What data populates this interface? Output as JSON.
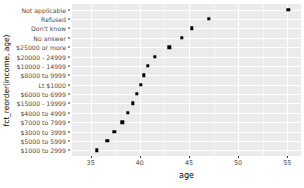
{
  "chart_data": {
    "type": "scatter",
    "title": "",
    "xlabel": "age",
    "ylabel": "fct_reorder(income, age)",
    "xlim": [
      33.1,
      56.4
    ],
    "x_ticks": [
      35,
      40,
      45,
      50,
      55
    ],
    "x_tick_labels": [
      "35",
      "40",
      "45",
      "50",
      "55"
    ],
    "x_minor_ticks": [
      37.5,
      42.5,
      47.5,
      52.5
    ],
    "grid": true,
    "legend": "none",
    "categories": [
      "Not applicable",
      "Refused",
      "Don't know",
      "No answer",
      "$25000 or more",
      "$20000 - 24999",
      "$10000 - 14999",
      "$8000 to 9999",
      "Lt $1000",
      "$6000 to 6999",
      "$15000 - 19999",
      "$4000 to 4999",
      "$7000 to 7999",
      "$3000 to 3999",
      "$5000 to 5999",
      "$1000 to 2999"
    ],
    "points": [
      {
        "category": "Not applicable",
        "age": 55.1
      },
      {
        "category": "Refused",
        "age": 47.0
      },
      {
        "category": "Don't know",
        "age": 45.3
      },
      {
        "category": "No answer",
        "age": 44.3
      },
      {
        "category": "$25000 or more",
        "age": 43.0
      },
      {
        "category": "$20000 - 24999",
        "age": 41.5
      },
      {
        "category": "$10000 - 14999",
        "age": 40.8
      },
      {
        "category": "$8000 to 9999",
        "age": 40.4
      },
      {
        "category": "Lt $1000",
        "age": 40.1
      },
      {
        "category": "$6000 to 6999",
        "age": 39.7
      },
      {
        "category": "$15000 - 19999",
        "age": 39.3
      },
      {
        "category": "$4000 to 4999",
        "age": 38.8
      },
      {
        "category": "$7000 to 7999",
        "age": 38.2
      },
      {
        "category": "$3000 to 3999",
        "age": 37.4
      },
      {
        "category": "$5000 to 5999",
        "age": 36.7
      },
      {
        "category": "$1000 to 2999",
        "age": 35.6
      }
    ],
    "colors": {
      "point": "#000000",
      "panel_background": "#ebebeb",
      "gridline": "#ffffff",
      "axis_text": "#4d4d4d",
      "axis_title": "#000000"
    }
  }
}
